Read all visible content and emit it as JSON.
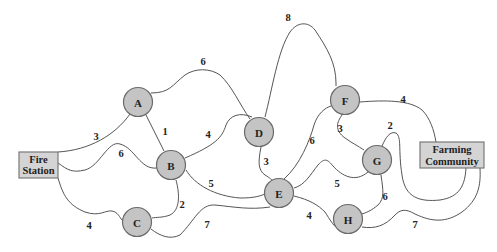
{
  "diagram": {
    "type": "weighted-network-graph",
    "terminals": {
      "source": {
        "line1": "Fire",
        "line2": "Station"
      },
      "sink": {
        "line1": "Farming",
        "line2": "Community"
      }
    },
    "nodes": {
      "A": "A",
      "B": "B",
      "C": "C",
      "D": "D",
      "E": "E",
      "F": "F",
      "G": "G",
      "H": "H"
    },
    "edges": [
      {
        "from": "Fire Station",
        "to": "A",
        "weight": "3"
      },
      {
        "from": "Fire Station",
        "to": "B",
        "weight": "6"
      },
      {
        "from": "Fire Station",
        "to": "C",
        "weight": "4"
      },
      {
        "from": "A",
        "to": "B",
        "weight": "1"
      },
      {
        "from": "A",
        "to": "D",
        "weight": "6"
      },
      {
        "from": "B",
        "to": "D",
        "weight": "4"
      },
      {
        "from": "B",
        "to": "C",
        "weight": "2"
      },
      {
        "from": "B",
        "to": "E",
        "weight": "5"
      },
      {
        "from": "C",
        "to": "E",
        "weight": "7"
      },
      {
        "from": "D",
        "to": "E",
        "weight": "3"
      },
      {
        "from": "D",
        "to": "F",
        "weight": "8"
      },
      {
        "from": "E",
        "to": "F",
        "weight": "6"
      },
      {
        "from": "E",
        "to": "G",
        "weight": "5"
      },
      {
        "from": "E",
        "to": "H",
        "weight": "4"
      },
      {
        "from": "F",
        "to": "G",
        "weight": "3"
      },
      {
        "from": "F",
        "to": "Farming Community",
        "weight": "4"
      },
      {
        "from": "G",
        "to": "H",
        "weight": "2"
      },
      {
        "from": "G",
        "to": "Farming Community",
        "weight": "6"
      },
      {
        "from": "H",
        "to": "Farming Community",
        "weight": "7"
      }
    ],
    "colors": {
      "node_fill": "#c4c4c4",
      "box_fill": "#d4d4d4",
      "edge": "#555555",
      "background": "#ffffff"
    }
  }
}
